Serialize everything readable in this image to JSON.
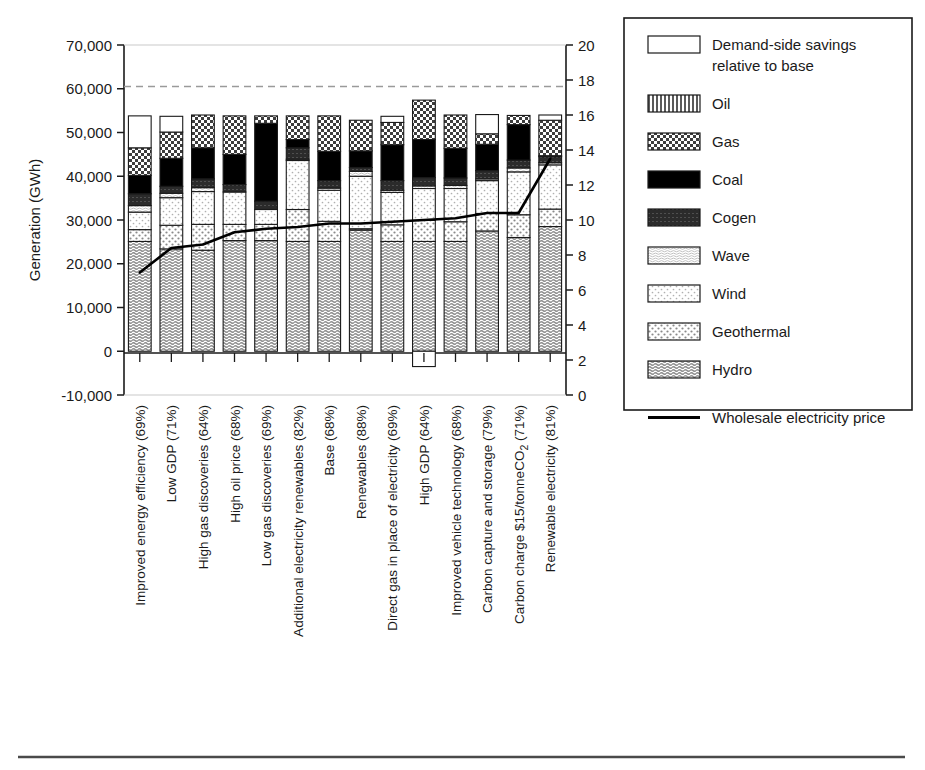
{
  "chart_data": {
    "type": "bar",
    "subtype": "stacked-bar-with-line",
    "title": "",
    "ylabel": "Generation (GWh)",
    "y2label": "Cost (cents per kWh)",
    "xlabel": "",
    "ylim": [
      -10000,
      70000
    ],
    "y2lim": [
      0,
      20
    ],
    "yticks": [
      "-10,000",
      "0",
      "10,000",
      "20,000",
      "30,000",
      "40,000",
      "50,000",
      "60,000",
      "70,000"
    ],
    "ytick_values": [
      -10000,
      0,
      10000,
      20000,
      30000,
      40000,
      50000,
      60000,
      70000
    ],
    "y2ticks": [
      "0",
      "2",
      "4",
      "6",
      "8",
      "10",
      "12",
      "14",
      "16",
      "18",
      "20"
    ],
    "y2tick_values": [
      0,
      2,
      4,
      6,
      8,
      10,
      12,
      14,
      16,
      18,
      20
    ],
    "grid": false,
    "reference_line": {
      "value": 60000,
      "style": "dashed",
      "label": ""
    },
    "legend_position": "right",
    "categories": [
      "Improved energy efficiency (69%)",
      "Low GDP (71%)",
      "High gas discoveries (64%)",
      "High oil price (68%)",
      "Low gas discoveries (69%)",
      "Additional electricity renewables (82%)",
      "Base (68%)",
      "Renewables (88%)",
      "Direct gas in place of electricity (69%)",
      "High GDP (64%)",
      "Improved vehicle technology (68%)",
      "Carbon capture and storage (79%)",
      "Carbon charge $15/tonneCO2 (71%)",
      "Renewable electricity (81%)"
    ],
    "series": [
      {
        "name": "Hydro",
        "values": [
          25100,
          23400,
          23100,
          25300,
          25300,
          25100,
          25100,
          27700,
          25100,
          25100,
          25100,
          27500,
          26000,
          28500
        ]
      },
      {
        "name": "Geothermal",
        "values": [
          2700,
          5400,
          5900,
          3700,
          3700,
          7300,
          4600,
          300,
          3800,
          4800,
          4500,
          4000,
          5200,
          4000
        ]
      },
      {
        "name": "Wind",
        "values": [
          4000,
          6300,
          7500,
          7400,
          3400,
          11200,
          7100,
          12000,
          7400,
          7300,
          7600,
          7500,
          9800,
          10100
        ]
      },
      {
        "name": "Wave",
        "values": [
          1500,
          1000,
          900,
          0,
          0,
          300,
          500,
          1100,
          500,
          600,
          700,
          400,
          900,
          500
        ]
      },
      {
        "name": "Cogen",
        "values": [
          2700,
          1600,
          2000,
          1700,
          1900,
          2600,
          1700,
          900,
          2200,
          1900,
          1700,
          1900,
          1800,
          1400
        ]
      },
      {
        "name": "Coal",
        "values": [
          4200,
          6400,
          7100,
          6900,
          17800,
          1900,
          6700,
          3800,
          8200,
          8700,
          6800,
          6000,
          8100,
          200
        ]
      },
      {
        "name": "Oil",
        "values": [
          0,
          0,
          0,
          0,
          0,
          0,
          0,
          0,
          0,
          0,
          0,
          0,
          0,
          0
        ]
      },
      {
        "name": "Gas",
        "values": [
          6300,
          6000,
          7500,
          8800,
          1700,
          5400,
          8100,
          7000,
          5100,
          9000,
          7600,
          2400,
          2100,
          8100
        ]
      },
      {
        "name": "Demand-side savings relative to base",
        "values": [
          7300,
          3600,
          0,
          0,
          0,
          0,
          0,
          0,
          1400,
          -3500,
          0,
          4400,
          0,
          1200
        ]
      }
    ],
    "stack_order": [
      "Hydro",
      "Geothermal",
      "Wind",
      "Wave",
      "Cogen",
      "Coal",
      "Oil",
      "Gas",
      "Demand-side savings relative to base"
    ],
    "bar_totals": [
      53800,
      53700,
      54000,
      53800,
      53800,
      53800,
      53800,
      52800,
      53700,
      57300,
      54000,
      54100,
      53900,
      54000
    ],
    "line_series": {
      "name": "Wholesale electricity price",
      "axis": "right",
      "unit": "cents per kWh",
      "values": [
        7.0,
        8.4,
        8.6,
        9.3,
        9.5,
        9.6,
        9.8,
        9.8,
        9.9,
        10.0,
        10.1,
        10.4,
        10.4,
        13.5
      ]
    }
  },
  "legend": {
    "items": [
      {
        "label": "Demand-side savings relative to base",
        "label_line1": "Demand-side savings",
        "label_line2": "relative to base",
        "pattern": "white",
        "type": "swatch"
      },
      {
        "label": "Oil",
        "pattern": "oil",
        "type": "swatch"
      },
      {
        "label": "Gas",
        "pattern": "gas",
        "type": "swatch"
      },
      {
        "label": "Coal",
        "pattern": "coal",
        "type": "swatch"
      },
      {
        "label": "Cogen",
        "pattern": "cogen",
        "type": "swatch"
      },
      {
        "label": "Wave",
        "pattern": "wave",
        "type": "swatch"
      },
      {
        "label": "Wind",
        "pattern": "wind",
        "type": "swatch"
      },
      {
        "label": "Geothermal",
        "pattern": "geothermal",
        "type": "swatch"
      },
      {
        "label": "Hydro",
        "pattern": "hydro",
        "type": "swatch"
      },
      {
        "label": "Wholesale electricity price",
        "pattern": "line",
        "type": "line"
      }
    ]
  },
  "colors": {
    "ink": "#1a1a1a",
    "coal": "#000000",
    "cogen": "#2e2e2e",
    "gas": "#4d4d4d",
    "white": "#ffffff",
    "grid": "#bdbdbd",
    "rule": "#4a4a4a"
  }
}
